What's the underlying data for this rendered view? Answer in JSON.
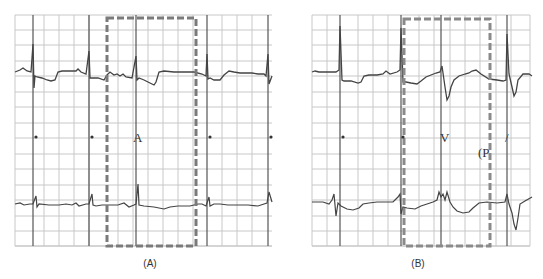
{
  "figure": {
    "panels": [
      {
        "id": "A",
        "caption": "(A)",
        "box_label": "A",
        "markers": [
          "•",
          "•",
          "•",
          "•"
        ]
      },
      {
        "id": "B",
        "caption": "(B)",
        "box_label": "V",
        "secondary_label": "(P",
        "slash_label": "/",
        "markers": [
          "•",
          "•"
        ]
      }
    ],
    "colors": {
      "grid": "#c8c8c8",
      "trace": "#444444",
      "sync_line": "#555555",
      "dashed_box": "#7a7a7a",
      "background": "#ffffff"
    }
  }
}
